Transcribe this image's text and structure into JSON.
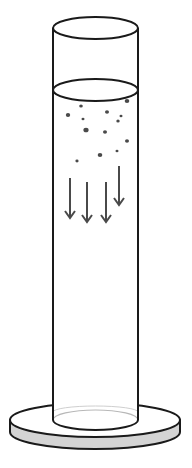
{
  "diagram": {
    "colors": {
      "outline": "#1a1a1a",
      "base_side": "#d4d4d4",
      "particle": "#4a4a4a",
      "arrow": "#4a4a4a",
      "inner_rim": "#b8b8b8",
      "background": "#ffffff"
    },
    "cylinder": {
      "left_x": 53,
      "right_x": 138,
      "top_y": 28,
      "rim_ry": 11,
      "liquid_y": 90,
      "liquid_ry": 11,
      "bottom_y": 420,
      "bottom_ry": 10
    },
    "base": {
      "left_x": 10,
      "right_x": 180,
      "top_y": 420,
      "ry": 17,
      "thickness": 12
    },
    "particles": [
      {
        "cx": 81,
        "cy": 106,
        "r": 1.8
      },
      {
        "cx": 127,
        "cy": 101,
        "r": 2.3
      },
      {
        "cx": 68,
        "cy": 115,
        "r": 2.2
      },
      {
        "cx": 107,
        "cy": 112,
        "r": 2.0
      },
      {
        "cx": 121,
        "cy": 116,
        "r": 1.5
      },
      {
        "cx": 83,
        "cy": 119,
        "r": 1.5
      },
      {
        "cx": 118,
        "cy": 121,
        "r": 1.7
      },
      {
        "cx": 86,
        "cy": 130,
        "r": 2.6
      },
      {
        "cx": 105,
        "cy": 132,
        "r": 2.0
      },
      {
        "cx": 127,
        "cy": 141,
        "r": 2.0
      },
      {
        "cx": 100,
        "cy": 155,
        "r": 2.3
      },
      {
        "cx": 117,
        "cy": 151,
        "r": 1.5
      },
      {
        "cx": 77,
        "cy": 161,
        "r": 1.6
      }
    ],
    "arrows": [
      {
        "x": 70,
        "y1": 178,
        "y2": 218
      },
      {
        "x": 87,
        "y1": 182,
        "y2": 222
      },
      {
        "x": 106,
        "y1": 182,
        "y2": 222
      },
      {
        "x": 119,
        "y1": 166,
        "y2": 205
      }
    ],
    "label": "Sedimentation in a cylinder"
  }
}
